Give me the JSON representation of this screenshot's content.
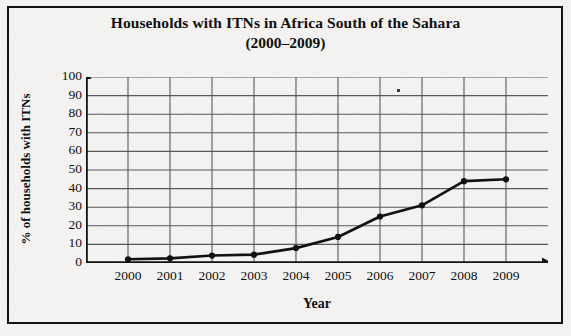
{
  "chart_data": {
    "type": "line",
    "title": "Households with ITNs in Africa South of the Sahara",
    "subtitle": "(2000–2009)",
    "xlabel": "Year",
    "ylabel": "% of households with ITNs",
    "categories": [
      "2000",
      "2001",
      "2002",
      "2003",
      "2004",
      "2005",
      "2006",
      "2007",
      "2008",
      "2009"
    ],
    "values": [
      2,
      2.5,
      4,
      4.5,
      8,
      14,
      25,
      31,
      44,
      45
    ],
    "series": [
      {
        "name": "% of households with ITNs",
        "values": [
          2,
          2.5,
          4,
          4.5,
          8,
          14,
          25,
          31,
          44,
          45
        ]
      }
    ],
    "ylim": [
      0,
      100
    ],
    "ytick_labels": [
      "0",
      "10",
      "20",
      "30",
      "40",
      "50",
      "60",
      "70",
      "80",
      "90",
      "100"
    ],
    "ytick_values": [
      0,
      10,
      20,
      30,
      40,
      50,
      60,
      70,
      80,
      90,
      100
    ],
    "grid": true,
    "legend": "none",
    "marker": "filled-circle",
    "line_color": "#111111",
    "grid_color": "#5a5a5a",
    "axis_color": "#111111",
    "background_color": "#f4f2f0"
  }
}
